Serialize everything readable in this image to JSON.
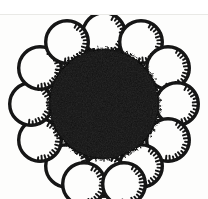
{
  "image": {
    "title": "Radial cluster of ringed discs around a solid dark core",
    "subject": "abstract-black-and-white-figure",
    "medium": "scanned-halftone-line-art",
    "width": 208,
    "height": 199,
    "background_color": "#fdfdfc",
    "top_margin_color": "#ffffff",
    "rule_color": "#e9e9e6",
    "ink_color": "#111111",
    "caption": ""
  },
  "scan_artifacts": {
    "top_margin_height": 14,
    "top_rule_y": 14,
    "top_rule_label": "page-edge-rule",
    "bottom_crop_note": "lower ring row clipped by image edge"
  },
  "core": {
    "label": "central-solid-disc",
    "center_x": 104,
    "center_y": 104,
    "radius": 55,
    "fill": "#131313",
    "edge_texture": "rough-speckled"
  },
  "ring_style": {
    "label": "serrated-ring",
    "stroke_color": "#141414",
    "stroke_width": 3.4,
    "fill": "#fdfdfc",
    "teeth_count": 15,
    "teeth_arc_start_deg": -62,
    "teeth_arc_end_deg": 96,
    "teeth_length": 5.0,
    "teeth_width": 1.9
  },
  "rings": [
    {
      "id": "ring-01",
      "position_label": "top",
      "cx": 104,
      "cy": 34,
      "r": 23,
      "teeth_rotation_deg": 0
    },
    {
      "id": "ring-02",
      "position_label": "top-right",
      "cx": 141,
      "cy": 42,
      "r": 23,
      "teeth_rotation_deg": 0
    },
    {
      "id": "ring-03",
      "position_label": "right-upper",
      "cx": 168,
      "cy": 68,
      "r": 23,
      "teeth_rotation_deg": 0
    },
    {
      "id": "ring-04",
      "position_label": "right",
      "cx": 177,
      "cy": 104,
      "r": 23,
      "teeth_rotation_deg": 0
    },
    {
      "id": "ring-05",
      "position_label": "right-lower",
      "cx": 168,
      "cy": 140,
      "r": 23,
      "teeth_rotation_deg": 0
    },
    {
      "id": "ring-06",
      "position_label": "bottom-right",
      "cx": 141,
      "cy": 166,
      "r": 23,
      "teeth_rotation_deg": 0
    },
    {
      "id": "ring-07",
      "position_label": "bottom",
      "cx": 104,
      "cy": 175,
      "r": 23,
      "teeth_rotation_deg": 0
    },
    {
      "id": "ring-08",
      "position_label": "bottom-left",
      "cx": 67,
      "cy": 166,
      "r": 23,
      "teeth_rotation_deg": 0
    },
    {
      "id": "ring-09",
      "position_label": "left-lower",
      "cx": 40,
      "cy": 140,
      "r": 23,
      "teeth_rotation_deg": 0
    },
    {
      "id": "ring-10",
      "position_label": "left",
      "cx": 31,
      "cy": 104,
      "r": 23,
      "teeth_rotation_deg": 0
    },
    {
      "id": "ring-11",
      "position_label": "left-upper",
      "cx": 40,
      "cy": 68,
      "r": 23,
      "teeth_rotation_deg": 0
    },
    {
      "id": "ring-12",
      "position_label": "top-left",
      "cx": 67,
      "cy": 42,
      "r": 23,
      "teeth_rotation_deg": 0
    },
    {
      "id": "ring-13",
      "position_label": "inner-lower-left",
      "cx": 84,
      "cy": 184,
      "r": 23,
      "teeth_rotation_deg": 0
    },
    {
      "id": "ring-14",
      "position_label": "inner-lower-right",
      "cx": 124,
      "cy": 184,
      "r": 23,
      "teeth_rotation_deg": 0
    }
  ]
}
